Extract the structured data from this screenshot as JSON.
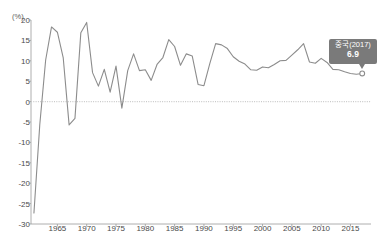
{
  "chart_data": {
    "type": "line",
    "title": "",
    "subtitle": "",
    "xlabel": "",
    "ylabel": "",
    "unit_label": "(%)",
    "xlim": [
      1960.5,
      2018.5
    ],
    "ylim": [
      -30,
      20
    ],
    "grid": false,
    "zero_line": true,
    "legend": "none",
    "series": [
      {
        "name": "중국",
        "color": "#8c8c8c",
        "x": [
          1961,
          1962,
          1963,
          1964,
          1965,
          1966,
          1967,
          1968,
          1969,
          1970,
          1971,
          1972,
          1973,
          1974,
          1975,
          1976,
          1977,
          1978,
          1979,
          1980,
          1981,
          1982,
          1983,
          1984,
          1985,
          1986,
          1987,
          1988,
          1989,
          1990,
          1991,
          1992,
          1993,
          1994,
          1995,
          1996,
          1997,
          1998,
          1999,
          2000,
          2001,
          2002,
          2003,
          2004,
          2005,
          2006,
          2007,
          2008,
          2009,
          2010,
          2011,
          2012,
          2013,
          2014,
          2015,
          2016,
          2017
        ],
        "values": [
          -27.3,
          -5.6,
          10.2,
          18.3,
          17.0,
          10.7,
          -5.7,
          -4.1,
          16.9,
          19.4,
          7.1,
          3.8,
          7.9,
          2.3,
          8.7,
          -1.6,
          7.6,
          11.7,
          7.6,
          7.8,
          5.2,
          9.1,
          10.8,
          15.2,
          13.5,
          8.9,
          11.7,
          11.2,
          4.2,
          3.9,
          9.3,
          14.2,
          13.9,
          13.0,
          11.0,
          9.9,
          9.2,
          7.8,
          7.7,
          8.5,
          8.3,
          9.1,
          10.0,
          10.1,
          11.4,
          12.7,
          14.2,
          9.7,
          9.4,
          10.6,
          9.6,
          7.9,
          7.8,
          7.3,
          6.9,
          6.7,
          6.9
        ]
      }
    ],
    "y_ticks": [
      20,
      15,
      10,
      5,
      0,
      -5,
      -10,
      -15,
      -20,
      -25,
      -30
    ],
    "y_tick_labels": [
      "20",
      "15",
      "10",
      "5",
      "0",
      "-5",
      "-10",
      "-15",
      "-20",
      "-25",
      "-30"
    ],
    "x_ticks": [
      1965,
      1970,
      1975,
      1980,
      1985,
      1990,
      1995,
      2000,
      2005,
      2010,
      2015
    ],
    "x_tick_labels": [
      "1965",
      "1970",
      "1975",
      "1980",
      "1985",
      "1990",
      "1995",
      "2000",
      "2005",
      "2010",
      "2015"
    ],
    "annotation": {
      "label": "중국(2017)",
      "value": "6.9",
      "point_x": 2017,
      "point_y": 6.9,
      "box_color": "#7a7a7a",
      "text_color": "#ffffff"
    }
  },
  "colors": {
    "line": "#8c8c8c",
    "axis": "#9a9a9a",
    "zero_line": "#c9c9c9",
    "tick_text": "#4a4a4a",
    "background": "#ffffff"
  }
}
